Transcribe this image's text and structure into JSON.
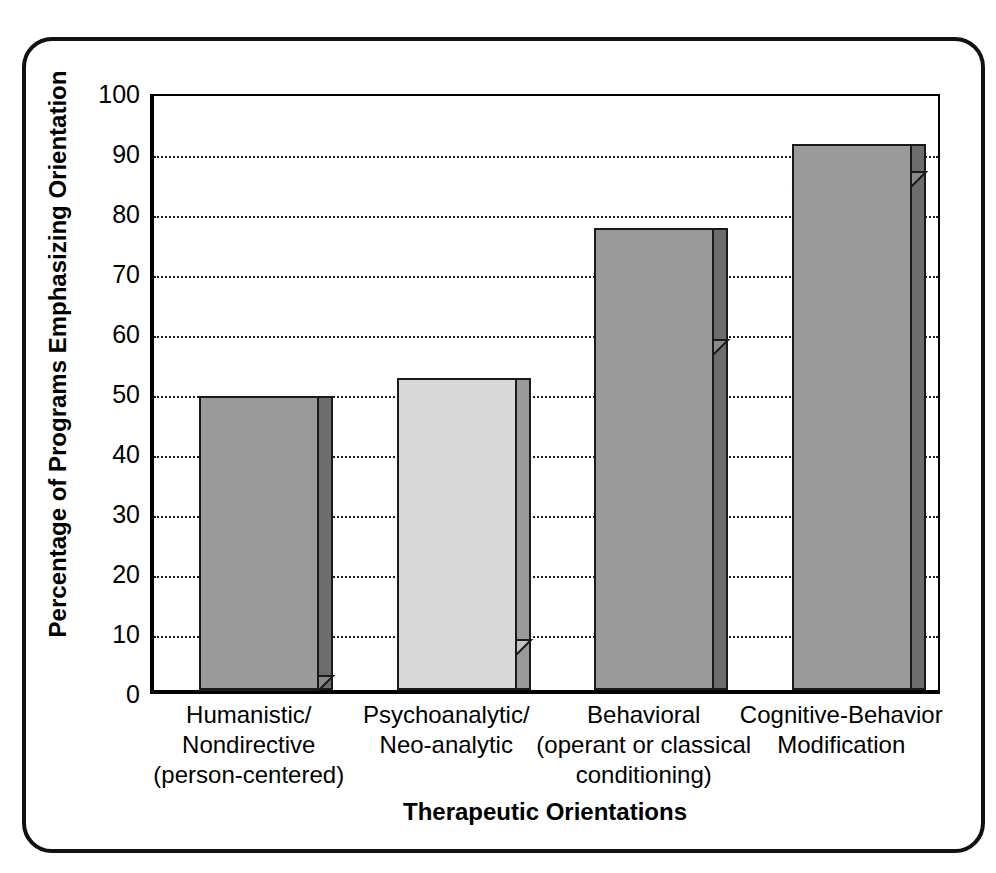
{
  "chart_data": {
    "type": "bar",
    "title": "",
    "subtitle": "",
    "categories": [
      "Humanistic/\nNondirective\n(person-centered)",
      "Psychoanalytic/\nNeo-analytic",
      "Behavioral\n(operant or classical\nconditioning)",
      "Cognitive-Behavior\nModification"
    ],
    "category_lines": [
      [
        "Humanistic/",
        "Nondirective",
        "(person-centered)"
      ],
      [
        "Psychoanalytic/",
        "Neo-analytic"
      ],
      [
        "Behavioral",
        "(operant or classical",
        "conditioning)"
      ],
      [
        "Cognitive-Behavior",
        "Modification"
      ]
    ],
    "values": [
      49,
      52,
      77,
      91
    ],
    "xlabel": "Therapeutic Orientations",
    "ylabel": "Percentage of Programs Emphasizing Orientation",
    "ylim": [
      0,
      100
    ],
    "ytick_labels": [
      "0",
      "10",
      "20",
      "30",
      "40",
      "50",
      "60",
      "70",
      "80",
      "90",
      "100"
    ],
    "ytick_values": [
      0,
      10,
      20,
      30,
      40,
      50,
      60,
      70,
      80,
      90,
      100
    ],
    "grid": "horizontal-dotted",
    "legend": "none",
    "bar_colors": [
      "#9a9a9a",
      "#d8d8d8",
      "#9a9a9a",
      "#9a9a9a"
    ],
    "bar_side_colors": [
      "#6d6d6d",
      "#9a9a9a",
      "#6d6d6d",
      "#6d6d6d"
    ],
    "bar_top_colors": [
      "#8a8a8a",
      "#c2c2c2",
      "#8a8a8a",
      "#8a8a8a"
    ],
    "outline_color": "#1a1a1a",
    "axis_color": "#000000",
    "gridline_color": "#222222",
    "background_color": "#ffffff",
    "style": "3d-isometric-bars"
  }
}
